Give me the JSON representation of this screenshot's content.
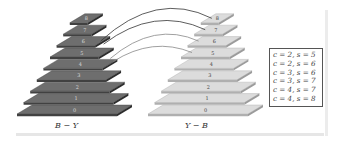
{
  "diagram": {
    "left_pyramid": {
      "label": "B − Y",
      "levels": [
        "0",
        "1",
        "2",
        "3",
        "4",
        "5",
        "6",
        "7",
        "8"
      ],
      "color": "#6e6e6e"
    },
    "right_pyramid": {
      "label": "Y − B",
      "levels": [
        "0",
        "1",
        "2",
        "3",
        "4",
        "5",
        "6",
        "7",
        "8"
      ],
      "color": "#dcdcdc"
    },
    "connections": [
      {
        "from_level": "6",
        "to_level": "8"
      },
      {
        "from_level": "6",
        "to_level": "7"
      },
      {
        "from_level": "5",
        "to_level": "6"
      },
      {
        "from_level": "5",
        "to_level": "5"
      }
    ],
    "legend": [
      "c = 2, s = 5",
      "c = 2, s = 6",
      "c = 3, s = 6",
      "c = 3, s = 7",
      "c = 4, s = 7",
      "c = 4, s = 8"
    ]
  }
}
